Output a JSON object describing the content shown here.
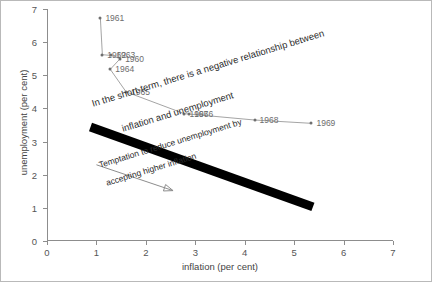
{
  "chart_data": {
    "type": "line",
    "title": "",
    "xlabel": "inflation (per cent)",
    "ylabel": "unemployment (per cent)",
    "xlim": [
      0,
      7
    ],
    "ylim": [
      0,
      7
    ],
    "xticks": [
      "0",
      "1",
      "2",
      "3",
      "4",
      "5",
      "6",
      "7"
    ],
    "yticks": [
      "0",
      "1",
      "2",
      "3",
      "4",
      "5",
      "6",
      "7"
    ],
    "grid": false,
    "legend": "none",
    "series": [
      {
        "name": "Phillips curve observations",
        "points": [
          {
            "label": "1961",
            "x": 1.08,
            "y": 6.72
          },
          {
            "label": "1962",
            "x": 1.12,
            "y": 5.62
          },
          {
            "label": "1963",
            "x": 1.3,
            "y": 5.6
          },
          {
            "label": "1960",
            "x": 1.48,
            "y": 5.5
          },
          {
            "label": "1964",
            "x": 1.28,
            "y": 5.18
          },
          {
            "label": "1965",
            "x": 1.6,
            "y": 4.5
          },
          {
            "label": "1967",
            "x": 2.78,
            "y": 3.84
          },
          {
            "label": "1966",
            "x": 2.88,
            "y": 3.83
          },
          {
            "label": "1968",
            "x": 4.2,
            "y": 3.65
          },
          {
            "label": "1969",
            "x": 5.35,
            "y": 3.55
          }
        ]
      }
    ],
    "trend_line": {
      "name": "short-run Phillips curve",
      "x0": 0.88,
      "y0": 3.44,
      "x1": 5.38,
      "y1": 1.03,
      "color": "#000000"
    },
    "annotations": [
      {
        "name": "negative-relationship-note",
        "text": "In the short-term, there is a negative relationship between",
        "x": 0.92,
        "y": 4.3,
        "rotation": -17
      },
      {
        "name": "negative-relationship-note-line2",
        "text": "inflation and unemployment",
        "x": 1.52,
        "y": 3.55,
        "rotation": -17
      },
      {
        "name": "temptation-note",
        "text": "Temptation to reduce unemployment by",
        "x": 1.05,
        "y": 2.44,
        "rotation": -17
      },
      {
        "name": "temptation-note-line2",
        "text": "accepting higher inflation",
        "x": 1.2,
        "y": 1.9,
        "rotation": -17
      }
    ],
    "arrow": {
      "name": "temptation-arrow",
      "x0": 1.0,
      "y0": 2.3,
      "x1": 2.55,
      "y1": 1.52,
      "color": "#8d8d8d"
    }
  }
}
